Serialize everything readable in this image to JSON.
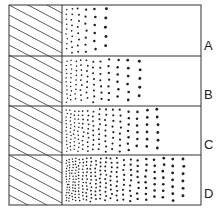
{
  "diagram": {
    "frame": {
      "x": 9,
      "y": 5,
      "w": 192,
      "h": 200
    },
    "source_right_x": 62,
    "row_boundaries_y": [
      5,
      56,
      106,
      155,
      205
    ],
    "stroke_color": "#333333",
    "dot_color": "#222222",
    "rows": [
      {
        "label": "A",
        "label_y": 47,
        "spread": 45,
        "density": 0.35
      },
      {
        "label": "B",
        "label_y": 96,
        "spread": 80,
        "density": 0.55
      },
      {
        "label": "C",
        "label_y": 146,
        "spread": 105,
        "density": 0.75
      },
      {
        "label": "D",
        "label_y": 195,
        "spread": 125,
        "density": 1.0
      }
    ]
  }
}
